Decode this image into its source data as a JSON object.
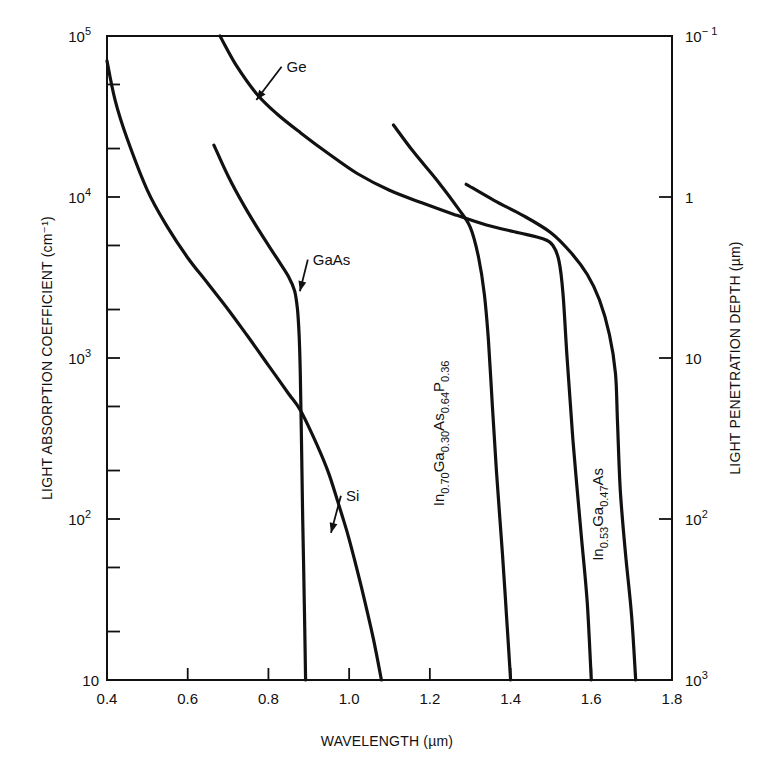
{
  "chart_data": {
    "type": "line",
    "title": "",
    "xlabel": "WAVELENGTH (µm)",
    "ylabel": "LIGHT ABSORPTION COEFFICIENT (cm⁻¹)",
    "y2label": "LIGHT PENETRATION DEPTH (µm)",
    "xlim": [
      0.4,
      1.8
    ],
    "ylim": [
      10,
      100000
    ],
    "yscale": "log",
    "grid": false,
    "legend": "inline curve labels",
    "x_ticks": [
      0.4,
      0.6,
      0.8,
      1.0,
      1.2,
      1.4,
      1.6,
      1.8
    ],
    "x_tick_labels": [
      "0.4",
      "0.6",
      "0.8",
      "1.0",
      "1.2",
      "1.4",
      "1.6",
      "1.8"
    ],
    "y_ticks": [
      10,
      100,
      1000,
      10000,
      100000
    ],
    "y_tick_labels": [
      {
        "base": "10",
        "exp": ""
      },
      {
        "base": "10",
        "exp": "2"
      },
      {
        "base": "10",
        "exp": "3"
      },
      {
        "base": "10",
        "exp": "4"
      },
      {
        "base": "10",
        "exp": "5"
      }
    ],
    "y_minor_ticks": [
      20,
      50,
      200,
      500,
      2000,
      5000,
      20000,
      50000
    ],
    "y2_ticks": [
      {
        "alpha": 100000,
        "base": "10",
        "exp": "− 1"
      },
      {
        "alpha": 10000,
        "base": "1",
        "exp": ""
      },
      {
        "alpha": 1000,
        "base": "10",
        "exp": ""
      },
      {
        "alpha": 100,
        "base": "10",
        "exp": "2"
      },
      {
        "alpha": 10,
        "base": "10",
        "exp": "3"
      }
    ],
    "series": [
      {
        "name": "Si",
        "label": {
          "text": "Si",
          "x": 0.992,
          "y": 130,
          "arrow_to": [
            0.955,
            82
          ]
        },
        "points": [
          [
            0.4,
            70000
          ],
          [
            0.42,
            40000
          ],
          [
            0.45,
            23000
          ],
          [
            0.5,
            11000
          ],
          [
            0.55,
            6500
          ],
          [
            0.6,
            4200
          ],
          [
            0.65,
            2900
          ],
          [
            0.7,
            2000
          ],
          [
            0.75,
            1350
          ],
          [
            0.8,
            900
          ],
          [
            0.85,
            600
          ],
          [
            0.88,
            470
          ],
          [
            0.92,
            290
          ],
          [
            0.95,
            190
          ],
          [
            0.98,
            110
          ],
          [
            1.0,
            75
          ],
          [
            1.03,
            38
          ],
          [
            1.06,
            18
          ],
          [
            1.08,
            10
          ]
        ]
      },
      {
        "name": "GaAs",
        "label": {
          "text": "GaAs",
          "x": 0.91,
          "y": 3800,
          "arrow_to": [
            0.878,
            2600
          ]
        },
        "points": [
          [
            0.665,
            21000
          ],
          [
            0.7,
            13500
          ],
          [
            0.74,
            8800
          ],
          [
            0.78,
            6000
          ],
          [
            0.82,
            4200
          ],
          [
            0.85,
            3200
          ],
          [
            0.865,
            2600
          ],
          [
            0.872,
            2000
          ],
          [
            0.876,
            1400
          ],
          [
            0.879,
            800
          ],
          [
            0.882,
            300
          ],
          [
            0.885,
            100
          ],
          [
            0.889,
            30
          ],
          [
            0.892,
            10
          ]
        ]
      },
      {
        "name": "Ge",
        "label": {
          "text": "Ge",
          "x": 0.845,
          "y": 60000,
          "arrow_to": [
            0.77,
            40000
          ]
        },
        "points": [
          [
            0.68,
            100000
          ],
          [
            0.72,
            66000
          ],
          [
            0.77,
            44000
          ],
          [
            0.82,
            33000
          ],
          [
            0.88,
            25000
          ],
          [
            0.95,
            18500
          ],
          [
            1.02,
            14000
          ],
          [
            1.1,
            11000
          ],
          [
            1.18,
            9200
          ],
          [
            1.26,
            7800
          ],
          [
            1.34,
            6700
          ],
          [
            1.42,
            6000
          ],
          [
            1.48,
            5500
          ],
          [
            1.505,
            5000
          ],
          [
            1.52,
            4000
          ],
          [
            1.53,
            2500
          ],
          [
            1.54,
            1000
          ],
          [
            1.555,
            300
          ],
          [
            1.575,
            80
          ],
          [
            1.59,
            30
          ],
          [
            1.6,
            10
          ]
        ]
      },
      {
        "name": "In0.70Ga0.30As0.64P0.36",
        "label": {
          "text": "In",
          "parts": [
            [
              "In",
              ""
            ],
            [
              "0.70",
              "sub"
            ],
            [
              "Ga",
              ""
            ],
            [
              "0.30",
              "sub"
            ],
            [
              "As",
              ""
            ],
            [
              "0.64",
              "sub"
            ],
            [
              "P",
              ""
            ],
            [
              "0.36",
              "sub"
            ]
          ],
          "x": 1.235,
          "y": 120,
          "rotate": -90
        },
        "points": [
          [
            1.11,
            28000
          ],
          [
            1.16,
            19000
          ],
          [
            1.22,
            12500
          ],
          [
            1.27,
            8500
          ],
          [
            1.3,
            6500
          ],
          [
            1.32,
            4300
          ],
          [
            1.335,
            2500
          ],
          [
            1.345,
            1300
          ],
          [
            1.355,
            500
          ],
          [
            1.365,
            200
          ],
          [
            1.38,
            60
          ],
          [
            1.39,
            25
          ],
          [
            1.4,
            10
          ]
        ]
      },
      {
        "name": "In0.53Ga0.47As",
        "label": {
          "text": "In",
          "parts": [
            [
              "In",
              ""
            ],
            [
              "0.53",
              "sub"
            ],
            [
              "Ga",
              ""
            ],
            [
              "0.47",
              "sub"
            ],
            [
              "As",
              ""
            ]
          ],
          "x": 1.628,
          "y": 55,
          "rotate": -90
        },
        "points": [
          [
            1.29,
            12000
          ],
          [
            1.36,
            9500
          ],
          [
            1.43,
            7700
          ],
          [
            1.5,
            6000
          ],
          [
            1.55,
            4500
          ],
          [
            1.59,
            3300
          ],
          [
            1.62,
            2300
          ],
          [
            1.645,
            1400
          ],
          [
            1.66,
            800
          ],
          [
            1.665,
            400
          ],
          [
            1.672,
            150
          ],
          [
            1.685,
            60
          ],
          [
            1.7,
            25
          ],
          [
            1.71,
            10
          ]
        ]
      }
    ]
  }
}
